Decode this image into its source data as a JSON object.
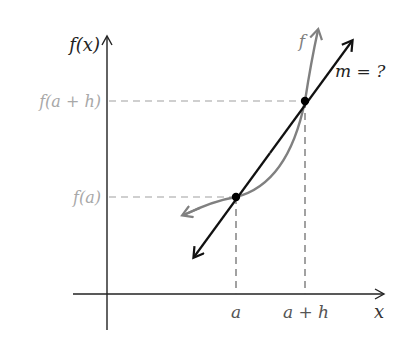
{
  "diagram": {
    "colors": {
      "axis": "#222222",
      "curve": "#808080",
      "secant": "#111111",
      "dashed": "#a0a0a0",
      "muted_label": "#a8a8a8",
      "dark_label": "#222222"
    },
    "labels": {
      "y_axis": "f(x)",
      "x_axis": "x",
      "y_fa_h": "f(a + h)",
      "y_fa": "f(a)",
      "x_a": "a",
      "x_a_h": "a + h",
      "curve": "f",
      "slope": "m = ?"
    },
    "points": [
      {
        "name": "P",
        "label": "(a, f(a))"
      },
      {
        "name": "Q",
        "label": "(a + h, f(a + h))"
      }
    ]
  }
}
